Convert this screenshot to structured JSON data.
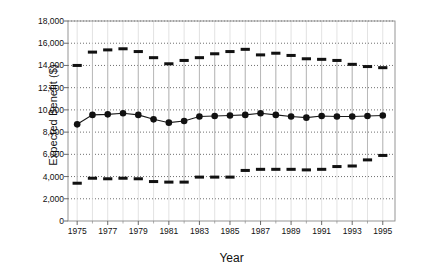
{
  "chart_data": {
    "type": "line",
    "title": "",
    "xlabel": "Year",
    "ylabel": "Expected Benefit ($)",
    "xlim": [
      1974.4,
      1995.8
    ],
    "ylim": [
      0,
      18000
    ],
    "grid": true,
    "legend": null,
    "xticks": [
      1975,
      1977,
      1979,
      1981,
      1983,
      1985,
      1987,
      1989,
      1991,
      1993,
      1995
    ],
    "xtick_labels": [
      "1975",
      "1977",
      "1979",
      "1981",
      "1983",
      "1985",
      "1987",
      "1989",
      "1991",
      "1993",
      "1995"
    ],
    "yticks": [
      0,
      2000,
      4000,
      6000,
      8000,
      10000,
      12000,
      14000,
      16000,
      18000
    ],
    "ytick_labels": [
      "0",
      "2,000",
      "4,000",
      "6,000",
      "8,000",
      "10,000",
      "12,000",
      "14,000",
      "16,000",
      "18,000"
    ],
    "x": [
      1975,
      1976,
      1977,
      1978,
      1979,
      1980,
      1981,
      1982,
      1983,
      1984,
      1985,
      1986,
      1987,
      1988,
      1989,
      1990,
      1991,
      1992,
      1993,
      1994,
      1995
    ],
    "series": [
      {
        "name": "Expected Benefit",
        "marker": "filled-circle",
        "values": [
          8700,
          9550,
          9600,
          9700,
          9550,
          9150,
          8850,
          9000,
          9400,
          9450,
          9500,
          9550,
          9700,
          9550,
          9400,
          9300,
          9450,
          9400,
          9400,
          9450,
          9500
        ]
      },
      {
        "name": "Upper Bound",
        "marker": "horizontal-dash",
        "values": [
          14000,
          15200,
          15400,
          15500,
          15250,
          14700,
          14150,
          14450,
          14700,
          15050,
          15250,
          15450,
          14950,
          15100,
          14900,
          14600,
          14550,
          14450,
          14100,
          13900,
          13800
        ]
      },
      {
        "name": "Lower Bound",
        "marker": "horizontal-dash",
        "values": [
          3400,
          3850,
          3800,
          3850,
          3800,
          3550,
          3500,
          3500,
          3950,
          3950,
          3950,
          4550,
          4650,
          4650,
          4650,
          4600,
          4650,
          4900,
          4950,
          5500,
          5900
        ]
      }
    ]
  }
}
